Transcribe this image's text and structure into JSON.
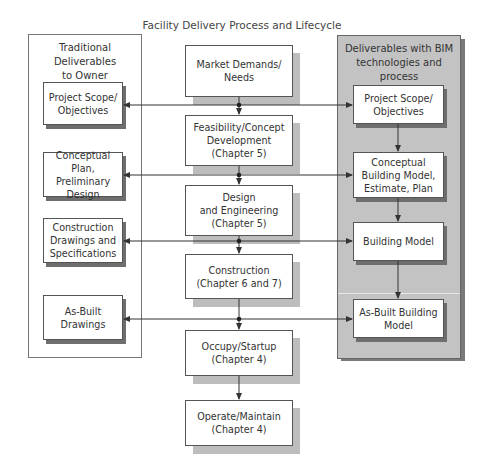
{
  "title": "Facility Delivery Process and Lifecycle",
  "left_panel": {
    "heading": "Traditional Deliverables\nto Owner",
    "items": [
      {
        "label": "Project Scope/\nObjectives"
      },
      {
        "label": "Conceptual Plan,\nPreliminary\nDesign"
      },
      {
        "label": "Construction\nDrawings and\nSpecifications"
      },
      {
        "label": "As-Built\nDrawings"
      }
    ]
  },
  "center_column": {
    "items": [
      {
        "label": "Market Demands/\nNeeds"
      },
      {
        "label": "Feasibility/Concept\nDevelopment\n(Chapter 5)"
      },
      {
        "label": "Design\nand Engineering\n(Chapter 5)"
      },
      {
        "label": "Construction\n(Chapter 6 and 7)"
      },
      {
        "label": "Occupy/Startup\n(Chapter 4)"
      },
      {
        "label": "Operate/Maintain\n(Chapter 4)"
      }
    ]
  },
  "right_panel": {
    "heading": "Deliverables with BIM\ntechnologies and process",
    "items": [
      {
        "label": "Project Scope/\nObjectives"
      },
      {
        "label": "Conceptual\nBuilding Model,\nEstimate, Plan"
      },
      {
        "label": "Building Model"
      },
      {
        "label": "As-Built Building\nModel"
      }
    ]
  },
  "colors": {
    "right_panel_fill": "#c3c3c3",
    "shadow": "#bdbdbd",
    "dark_shadow": "#6e6e6e",
    "line": "#333333"
  }
}
